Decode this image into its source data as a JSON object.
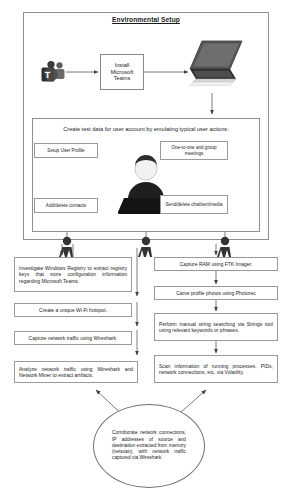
{
  "diagram": {
    "title": "Environmental Setup",
    "type": "flowchart",
    "setup_section": {
      "install_box": {
        "lines": [
          "Install",
          "Microsoft",
          "Teams"
        ],
        "full_text": "Install Microsoft Teams"
      },
      "icons": {
        "source": "microsoft-teams-logo-icon",
        "target": "laptop-icon"
      },
      "test_data_caption": "Create test data for user account by emulating typical user actions:",
      "user_actions": [
        {
          "id": "setup-user-profile",
          "label": "Setup User Profile"
        },
        {
          "id": "one-to-one-and-group-meetings",
          "label": "One-to-one and group meetings"
        },
        {
          "id": "add-delete-contacts",
          "label": "Add/delete contacts"
        },
        {
          "id": "send-delete-chat-text-media",
          "label": "Send/delete chat/text/media"
        }
      ],
      "center_icon": "person-at-laptop-icon"
    },
    "left_column": [
      {
        "id": "investigate-windows-registry",
        "label": "Investigate Windows Registry to extract registry keys that store configuration information regarding Microsoft Teams."
      },
      {
        "id": "create-wifi-hotspot",
        "label": "Create a unique Wi-Fi hotspot."
      },
      {
        "id": "capture-network-traffic",
        "label": "Capture network traffic using Wireshark."
      },
      {
        "id": "analyze-network-traffic",
        "label": "Analyze network traffic using Wireshark and Network Miner to extract artifacts."
      }
    ],
    "right_column": [
      {
        "id": "capture-ram",
        "label": "Capture RAM using FTK Imager."
      },
      {
        "id": "carve-profile-photos",
        "label": "Carve profile photos using Photorec"
      },
      {
        "id": "manual-string-searching",
        "label": "Perform manual string searching via Strings tool using relevant keywords or phrases."
      },
      {
        "id": "scan-running-processes",
        "label": "Scan information of running processes, PIDs, network connections, etc. via Volatility."
      }
    ],
    "conclusion": {
      "id": "corroborate-network-connections",
      "label": "Corroborate network connections, IP addresses of source and destination extracted from memory (netscan), with network traffic captured via Wireshark."
    },
    "colors": {
      "border": "#8f8f8f",
      "text": "#1c1c1c",
      "background": "#ffffff",
      "arrow": "#4a4a4a"
    }
  }
}
